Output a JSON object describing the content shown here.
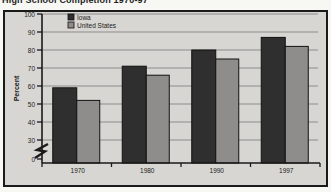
{
  "title": "High School Completion 1970-97",
  "chart_data": {
    "type": "bar",
    "title": "High School Completion 1970-97",
    "categories": [
      "1970",
      "1980",
      "1990",
      "1997"
    ],
    "series": [
      {
        "name": "Iowa",
        "color": "#2f2f2f",
        "values": [
          59,
          71,
          80,
          87
        ]
      },
      {
        "name": "United States",
        "color": "#8e8d8b",
        "values": [
          52,
          66,
          75,
          82
        ]
      }
    ],
    "xlabel": "",
    "ylabel": "Percent",
    "ylim": [
      0,
      100
    ],
    "yticks": [
      0,
      30,
      40,
      50,
      60,
      70,
      80,
      90,
      100
    ],
    "axis_break_between": [
      0,
      30
    ],
    "grid": true,
    "legend_position": "top-left-inside"
  },
  "colors": {
    "page_bg": "#f7f7f4",
    "chart_bg": "#d7d6d2",
    "gridline": "#8c8c8c",
    "axis": "#1a1a1a",
    "bar_border": "#111111",
    "iowa_bar": "#2f2f2f",
    "us_bar": "#8e8d8b",
    "text": "#1a1a1a"
  }
}
